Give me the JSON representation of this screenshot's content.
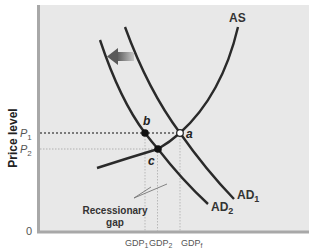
{
  "diagram": {
    "y_axis_label": "Price level",
    "origin_label": "0",
    "price_levels": [
      {
        "id": "P1",
        "base": "P",
        "sub": "1"
      },
      {
        "id": "P2",
        "base": "P",
        "sub": "2"
      }
    ],
    "gdp_levels": [
      {
        "id": "GDP1",
        "base": "GDP",
        "sub": "1"
      },
      {
        "id": "GDP2",
        "base": "GDP",
        "sub": "2"
      },
      {
        "id": "GDPf",
        "base": "GDP",
        "sub": "f"
      }
    ],
    "curves": {
      "as": {
        "label": "AS"
      },
      "ad1": {
        "base": "AD",
        "sub": "1"
      },
      "ad2": {
        "base": "AD",
        "sub": "2"
      }
    },
    "points": {
      "a": {
        "label": "a",
        "style": "open",
        "price": "P1",
        "output": "GDPf"
      },
      "b": {
        "label": "b",
        "style": "filled",
        "price": "P1",
        "output": "GDP1"
      },
      "c": {
        "label": "c",
        "style": "filled",
        "price": "P2",
        "output": "GDP2"
      }
    },
    "shift_arrow": {
      "direction": "left",
      "meaning": "AD shifts from AD1 to AD2"
    },
    "annotation": {
      "line1": "Recessionary",
      "line2": "gap"
    },
    "colors": {
      "plot_background": "#e8e8e8",
      "axis": "#a8a8a8",
      "curve": "#2a2a2a",
      "arrow": "#777777",
      "point_open_fill": "#ffffff"
    }
  }
}
